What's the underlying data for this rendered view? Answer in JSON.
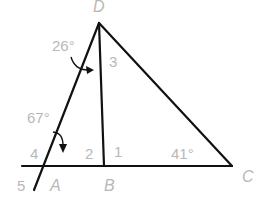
{
  "diagram": {
    "type": "geometry-triangle",
    "points": {
      "D": "D",
      "A": "A",
      "B": "B",
      "C": "C"
    },
    "angle_labels": {
      "angle_3": "3",
      "angle_1": "1",
      "angle_2": "2",
      "angle_4": "4",
      "angle_5": "5"
    },
    "angle_measures": {
      "top_left": "26°",
      "left": "67°",
      "at_C": "41°"
    },
    "colors": {
      "lines": "#111111",
      "labels": "#b8b8b8"
    }
  }
}
